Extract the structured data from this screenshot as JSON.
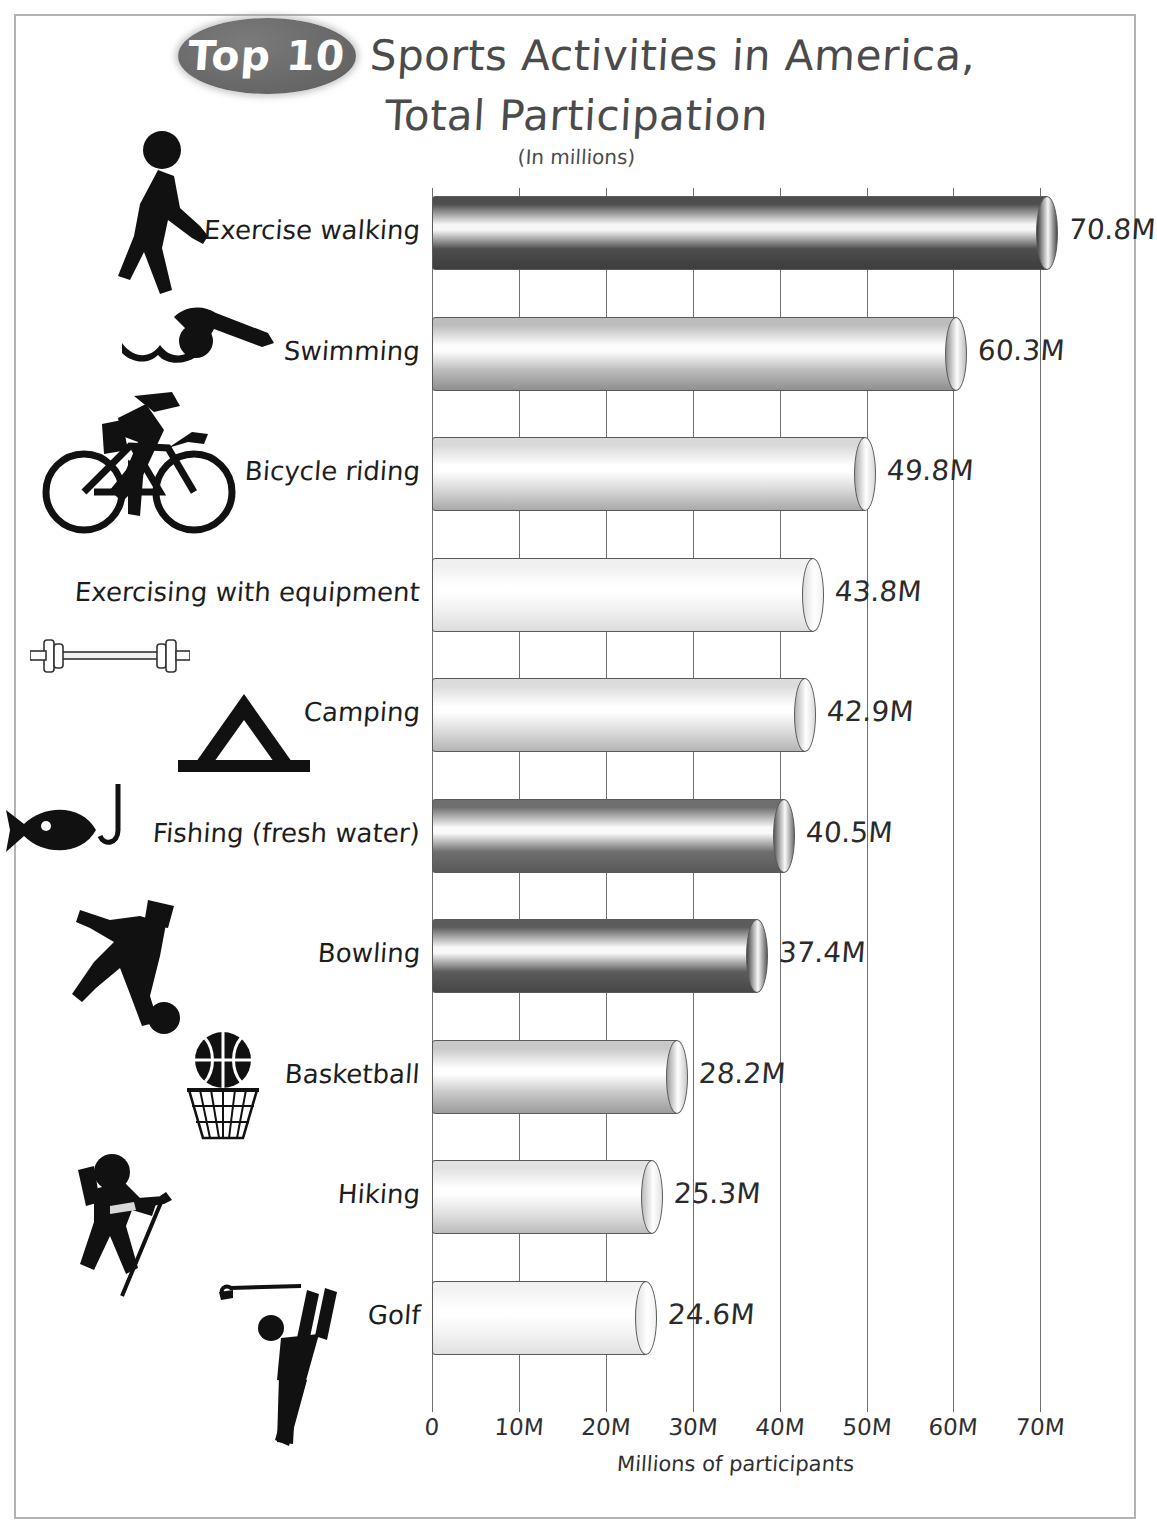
{
  "header": {
    "badge": "Top 10",
    "title_line1": "Sports Activities in America,",
    "title_line2": "Total Participation",
    "subtitle": "(In millions)",
    "badge_color": "#6a6a6a",
    "title_color": "#4b4b4b"
  },
  "chart_data": {
    "type": "bar",
    "orientation": "horizontal",
    "title": "Top 10 Sports Activities in America, Total Participation",
    "subtitle": "(In millions)",
    "xlabel": "Millions of participants",
    "ylabel": "",
    "xlim": [
      0,
      70
    ],
    "grid": true,
    "legend": "none",
    "categories": [
      "Exercise walking",
      "Swimming",
      "Bicycle riding",
      "Exercising with equipment",
      "Camping",
      "Fishing (fresh water)",
      "Bowling",
      "Basketball",
      "Hiking",
      "Golf"
    ],
    "values": [
      70.8,
      60.3,
      49.8,
      43.8,
      42.9,
      40.5,
      37.4,
      28.2,
      25.3,
      24.6
    ],
    "value_labels": [
      "70.8M",
      "60.3M",
      "49.8M",
      "43.8M",
      "42.9M",
      "40.5M",
      "37.4M",
      "28.2M",
      "25.3M",
      "24.6M"
    ],
    "xticks": [
      0,
      10,
      20,
      30,
      40,
      50,
      60,
      70
    ],
    "xticklabels": [
      "0",
      "10M",
      "20M",
      "30M",
      "40M",
      "50M",
      "60M",
      "70M"
    ],
    "icons": [
      "walking-icon",
      "swimming-icon",
      "bicycle-icon",
      "barbell-icon",
      "tent-icon",
      "fish-hook-icon",
      "bowling-icon",
      "basketball-hoop-icon",
      "hiking-icon",
      "golf-icon"
    ]
  },
  "axis": {
    "x_title": "Millions of participants"
  }
}
